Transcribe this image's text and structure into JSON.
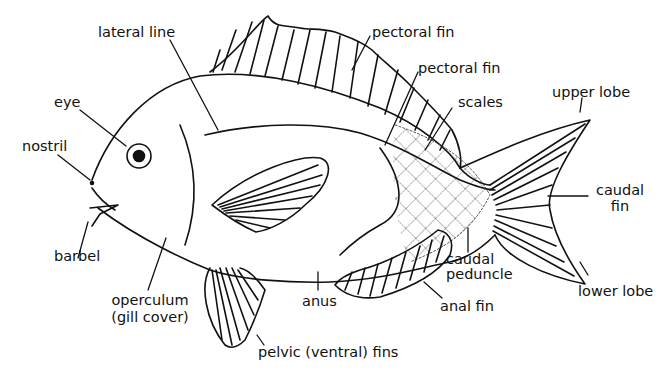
{
  "diagram": {
    "ink_color": "#111111",
    "background": "#ffffff",
    "labels": {
      "lateral_line": "lateral line",
      "eye": "eye",
      "nostril": "nostril",
      "barbel": "barbel",
      "operculum_1": "operculum",
      "operculum_2": "(gill cover)",
      "pelvic": "pelvic (ventral) fins",
      "anus": "anus",
      "anal_fin": "anal fin",
      "caudal_peduncle_1": "caudal",
      "caudal_peduncle_2": "peduncle",
      "lower_lobe": "lower lobe",
      "caudal_fin_1": "caudal",
      "caudal_fin_2": "fin",
      "upper_lobe": "upper lobe",
      "scales": "scales",
      "pectoral_fin_upper": "pectoral fin",
      "pectoral_fin_lower": "pectoral fin"
    }
  }
}
